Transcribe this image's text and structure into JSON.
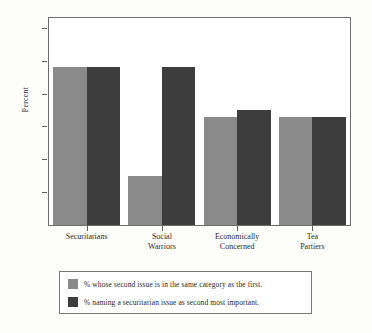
{
  "chart_data": {
    "type": "bar",
    "title": "",
    "xlabel": "",
    "ylabel": "Percent",
    "ylim": [
      0,
      63
    ],
    "grid": false,
    "legend_position": "bottom",
    "categories": [
      "Securitarians",
      "Social\nWarriors",
      "Economically\nConcerned",
      "Tea\nPartiers"
    ],
    "ytick_labels": [
      "10",
      "20",
      "30",
      "40",
      "50",
      "60"
    ],
    "ytick_values": [
      10,
      20,
      30,
      40,
      50,
      60
    ],
    "series": [
      {
        "name": "% whose second issue is in the same category as the first.",
        "color": "#8a8a8a",
        "values": [
          48,
          15,
          33,
          33
        ]
      },
      {
        "name": "% naming a securitarian issue as second most important.",
        "color": "#3d3d3d",
        "values": [
          48,
          48,
          35,
          33
        ]
      }
    ]
  },
  "legend": {
    "entries": [
      {
        "label": "% whose second issue is in the same category as the first."
      },
      {
        "label": "% naming a securitarian issue as second most important."
      }
    ]
  }
}
